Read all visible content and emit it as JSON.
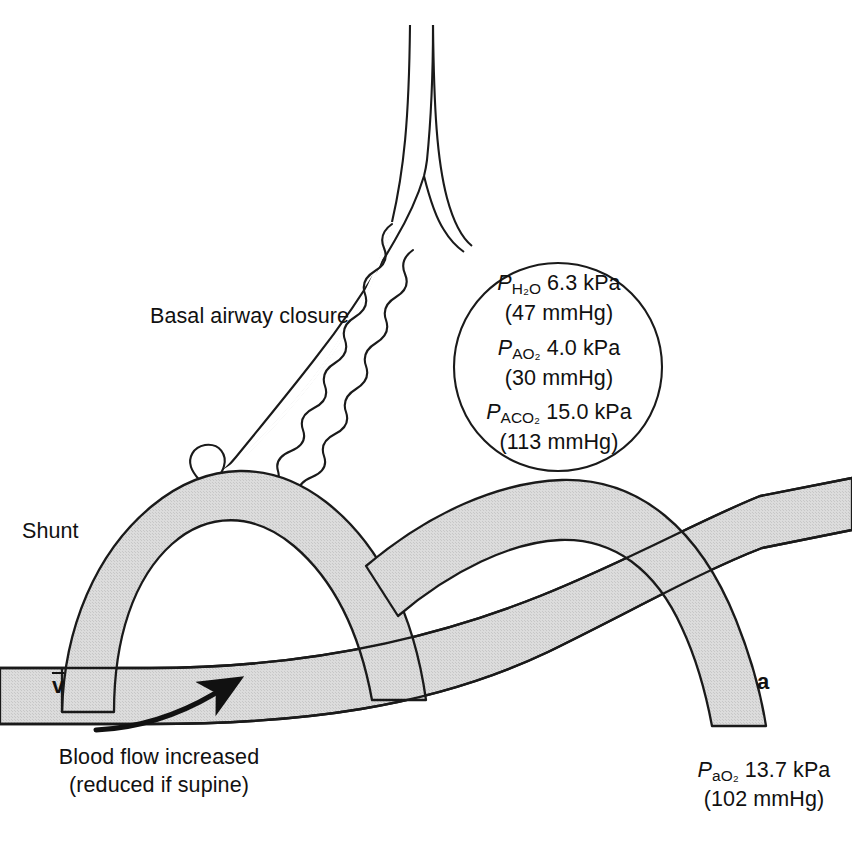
{
  "figure": {
    "type": "physiology-diagram"
  },
  "alveolus": {
    "gas_values": [
      {
        "symbol": "P",
        "subscript": "H₂O",
        "value": "6.3 kPa",
        "converted": "(47 mmHg)"
      },
      {
        "symbol": "P",
        "subscript": "AO₂",
        "value": "4.0 kPa",
        "converted": "(30 mmHg)"
      },
      {
        "symbol": "P",
        "subscript": "ACO₂",
        "value": "15.0 kPa",
        "converted": "(113 mmHg)"
      }
    ]
  },
  "labels": {
    "basal_airway_closure": "Basal airway closure",
    "shunt": "Shunt",
    "blood_flow_line1": "Blood flow increased",
    "blood_flow_line2": "(reduced if supine)",
    "mixed_venous_symbol": "v",
    "arterial_symbol": "a"
  },
  "arterial_gas": {
    "symbol": "P",
    "subscript": "a",
    "subscript2": "O₂",
    "value": "13.7 kPa",
    "converted": "(102 mmHg)"
  },
  "colors": {
    "vessel_fill": "#d9d9d9",
    "stroke": "#1a1a1a",
    "background": "#ffffff",
    "text": "#111111"
  }
}
